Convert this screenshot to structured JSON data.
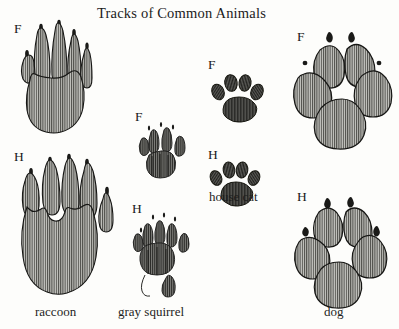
{
  "figure": {
    "title": "Tracks of Common Animals",
    "background_color": "#fdfdfb",
    "ink_color": "#1a1a1a",
    "pad_fill_color": "#9a9a96",
    "type": "illustration-plate",
    "medium": "pen-and-ink engraving style with vertical line hatching"
  },
  "labels": {
    "front_abbr": "F",
    "hind_abbr": "H"
  },
  "animals": [
    {
      "id": "raccoon",
      "name": "raccoon",
      "tracks": [
        {
          "foot": "F",
          "foot_name": "front",
          "toes": 5,
          "claws_visible": true,
          "description": "five long slender finger-like toes with small claw marks, broad oval palm pad"
        },
        {
          "foot": "H",
          "foot_name": "hind",
          "toes": 5,
          "claws_visible": true,
          "description": "elongated foot with five toes and long heel, claw marks above toes"
        }
      ]
    },
    {
      "id": "gray-squirrel",
      "name": "gray squirrel",
      "tracks": [
        {
          "foot": "F",
          "foot_name": "front",
          "toes": 4,
          "claws_visible": true,
          "description": "four elongated toes fanned above a cluster of palm pads"
        },
        {
          "foot": "H",
          "foot_name": "hind",
          "toes": 5,
          "claws_visible": true,
          "description": "five toes, palm pad cluster and a long narrow heel mark"
        }
      ]
    },
    {
      "id": "house-cat",
      "name": "house cat",
      "tracks": [
        {
          "foot": "F",
          "foot_name": "front",
          "toes": 4,
          "claws_visible": false,
          "description": "four rounded toe pads in an arc above a trilobed heel pad, no claw marks"
        },
        {
          "foot": "H",
          "foot_name": "hind",
          "toes": 4,
          "claws_visible": false,
          "description": "four rounded toe pads above a trilobed heel pad, no claw marks"
        }
      ]
    },
    {
      "id": "dog",
      "name": "dog",
      "tracks": [
        {
          "foot": "F",
          "foot_name": "front",
          "toes": 4,
          "claws_visible": true,
          "description": "four large oval toe pads with claw marks above a large trilobed heel pad"
        },
        {
          "foot": "H",
          "foot_name": "hind",
          "toes": 4,
          "claws_visible": true,
          "description": "four oval toe pads with claw marks above a large trilobed heel pad"
        }
      ]
    }
  ]
}
